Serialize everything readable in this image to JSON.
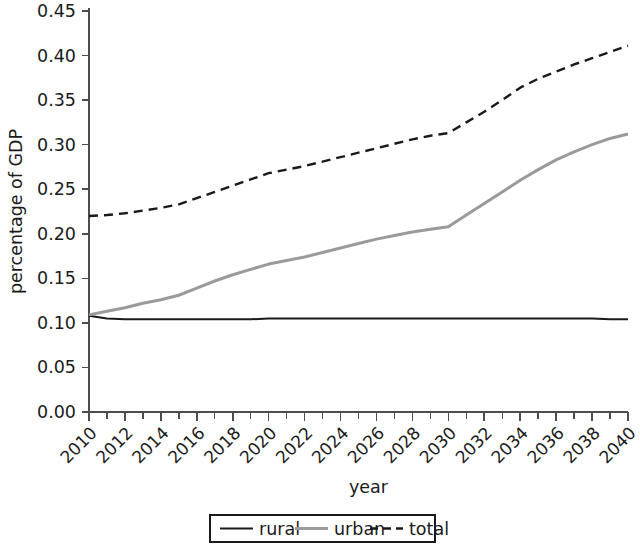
{
  "chart_data": {
    "type": "line",
    "title": "",
    "xlabel": "year",
    "ylabel": "percentage of GDP",
    "xlim": [
      2010,
      2040
    ],
    "ylim": [
      0.0,
      0.45
    ],
    "grid": false,
    "legend_position": "bottom",
    "x_tick_labels": [
      "2010",
      "2012",
      "2014",
      "2016",
      "2018",
      "2020",
      "2022",
      "2024",
      "2026",
      "2028",
      "2030",
      "2032",
      "2034",
      "2036",
      "2038",
      "2040"
    ],
    "x_tick_values": [
      2010,
      2012,
      2014,
      2016,
      2018,
      2020,
      2022,
      2024,
      2026,
      2028,
      2030,
      2032,
      2034,
      2036,
      2038,
      2040
    ],
    "x_minor_tick_values": [
      2011,
      2013,
      2015,
      2017,
      2019,
      2021,
      2023,
      2025,
      2027,
      2029,
      2031,
      2033,
      2035,
      2037,
      2039
    ],
    "y_tick_labels": [
      "0.00",
      "0.05",
      "0.10",
      "0.15",
      "0.20",
      "0.25",
      "0.30",
      "0.35",
      "0.40",
      "0.45"
    ],
    "y_tick_values": [
      0.0,
      0.05,
      0.1,
      0.15,
      0.2,
      0.25,
      0.3,
      0.35,
      0.4,
      0.45
    ],
    "x": [
      2010,
      2011,
      2012,
      2013,
      2014,
      2015,
      2016,
      2017,
      2018,
      2019,
      2020,
      2021,
      2022,
      2023,
      2024,
      2025,
      2026,
      2027,
      2028,
      2029,
      2030,
      2031,
      2032,
      2033,
      2034,
      2035,
      2036,
      2037,
      2038,
      2039,
      2040
    ],
    "series": [
      {
        "name": "rural",
        "color": "#1a1a1a",
        "style": "solid",
        "width": 2.0,
        "values": [
          0.108,
          0.105,
          0.104,
          0.104,
          0.104,
          0.104,
          0.104,
          0.104,
          0.104,
          0.104,
          0.105,
          0.105,
          0.105,
          0.105,
          0.105,
          0.105,
          0.105,
          0.105,
          0.105,
          0.105,
          0.105,
          0.105,
          0.105,
          0.105,
          0.105,
          0.105,
          0.105,
          0.105,
          0.105,
          0.104,
          0.104
        ]
      },
      {
        "name": "urban",
        "color": "#9a9a9a",
        "style": "solid",
        "width": 3.0,
        "values": [
          0.109,
          0.113,
          0.117,
          0.122,
          0.126,
          0.131,
          0.139,
          0.147,
          0.154,
          0.16,
          0.166,
          0.17,
          0.174,
          0.179,
          0.184,
          0.189,
          0.194,
          0.198,
          0.202,
          0.205,
          0.208,
          0.221,
          0.234,
          0.247,
          0.26,
          0.272,
          0.283,
          0.292,
          0.3,
          0.307,
          0.312
        ]
      },
      {
        "name": "total",
        "color": "#1a1a1a",
        "style": "dashed",
        "width": 2.4,
        "values": [
          0.22,
          0.221,
          0.223,
          0.226,
          0.229,
          0.233,
          0.24,
          0.247,
          0.254,
          0.261,
          0.268,
          0.272,
          0.276,
          0.281,
          0.286,
          0.291,
          0.296,
          0.301,
          0.306,
          0.31,
          0.313,
          0.325,
          0.337,
          0.35,
          0.364,
          0.374,
          0.382,
          0.39,
          0.397,
          0.404,
          0.411
        ]
      }
    ]
  },
  "legend": {
    "items": [
      {
        "label": "rural"
      },
      {
        "label": "urban"
      },
      {
        "label": "total"
      }
    ]
  }
}
